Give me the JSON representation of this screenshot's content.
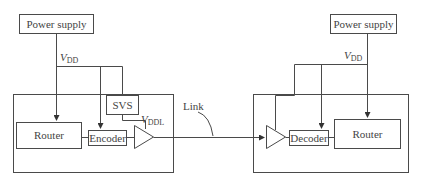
{
  "diagram": {
    "type": "block-diagram",
    "colors": {
      "stroke": "#4a4a4a",
      "text": "#444444",
      "background": "#ffffff"
    },
    "transmitter": {
      "power_supply": "Power supply",
      "vdd_label": {
        "main": "V",
        "sub": "DD"
      },
      "vddl_label": {
        "main": "V",
        "sub": "DDL"
      },
      "svs": "SVS",
      "router": "Router",
      "encoder": "Encoder"
    },
    "link": {
      "label": "Link"
    },
    "receiver": {
      "power_supply": "Power supply",
      "vdd_label": {
        "main": "V",
        "sub": "DD"
      },
      "decoder": "Decoder",
      "router": "Router"
    }
  }
}
